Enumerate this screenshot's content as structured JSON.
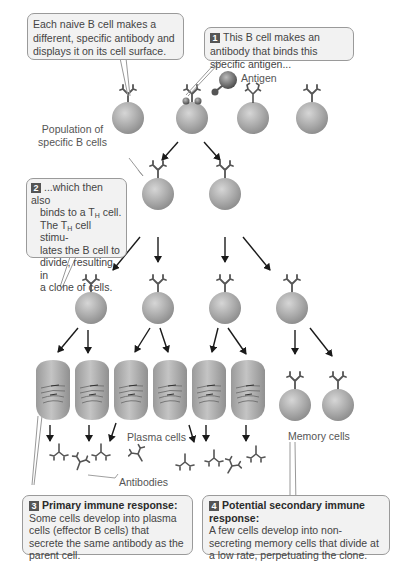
{
  "callouts": {
    "naive": {
      "text": "Each naive B cell makes a different, specific antibody and displays it on its cell surface."
    },
    "step1": {
      "number": "1",
      "text": "This B cell makes an antibody that binds this specific antigen..."
    },
    "step2": {
      "number": "2",
      "line1": "...which then also",
      "line2_pre": "binds to a T",
      "line2_sub": "H",
      "line2_post": " cell.",
      "line3_pre": "The T",
      "line3_sub": "H",
      "line3_post": " cell stimu-",
      "line4": "lates the B cell to",
      "line5": "divide, resulting in",
      "line6": "a clone of cells."
    },
    "step3": {
      "number": "3",
      "title": "Primary immune response:",
      "text": "Some cells develop into plasma cells (effector B cells) that secrete the same antibody as the parent cell."
    },
    "step4": {
      "number": "4",
      "title": "Potential secondary immune response:",
      "text": "A few cells develop into non-secreting memory cells that divide at a low rate, perpetuating the clone."
    }
  },
  "labels": {
    "antigen": "Antigen",
    "population_line1": "Population of",
    "population_line2": "specific B cells",
    "plasma_cells": "Plasma cells",
    "memory_cells": "Memory cells",
    "antibodies": "Antibodies"
  },
  "colors": {
    "cell_fill": "#a8a8a8",
    "callout_bg": "#f2f2f2",
    "badge": "#555555",
    "arrow": "#1a1a1a"
  }
}
